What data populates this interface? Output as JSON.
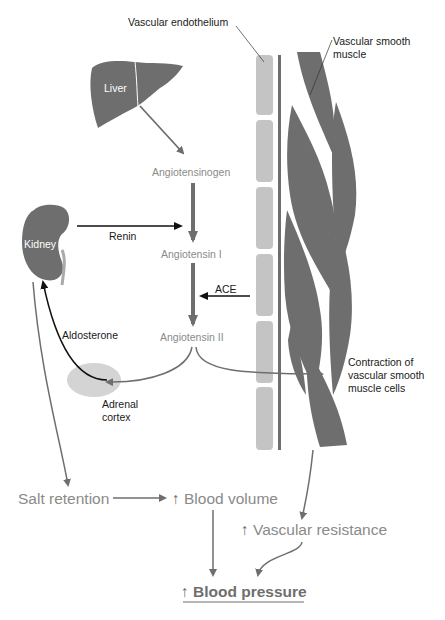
{
  "diagram": {
    "colors": {
      "organ": "#6e6e6e",
      "endothelium": "#c4c4c4",
      "muscle": "#6e6e6e",
      "adrenal": "#d4d4d4",
      "arrow_gray": "#6e6e6e",
      "arrow_black": "#111111",
      "text_gray": "#8a8a8a",
      "text_black": "#1a1a1a"
    },
    "labels": {
      "vascular_endothelium": "Vascular endothelium",
      "vascular_smooth_muscle_line1": "Vascular smooth",
      "vascular_smooth_muscle_line2": "muscle",
      "liver": "Liver",
      "angiotensinogen": "Angiotensinogen",
      "kidney": "Kidney",
      "renin": "Renin",
      "angiotensin_1": "Angiotensin I",
      "ace": "ACE",
      "angiotensin_2": "Angiotensin II",
      "aldosterone": "Aldosterone",
      "adrenal_cortex_line1": "Adrenal",
      "adrenal_cortex_line2": "cortex",
      "contraction_line1": "Contraction of",
      "contraction_line2": "vascular smooth",
      "contraction_line3": "muscle cells",
      "salt_retention": "Salt retention",
      "up_arrow": "↑",
      "blood_volume": "Blood volume",
      "vascular_resistance": "Vascular resistance",
      "blood_pressure": "Blood pressure"
    }
  }
}
